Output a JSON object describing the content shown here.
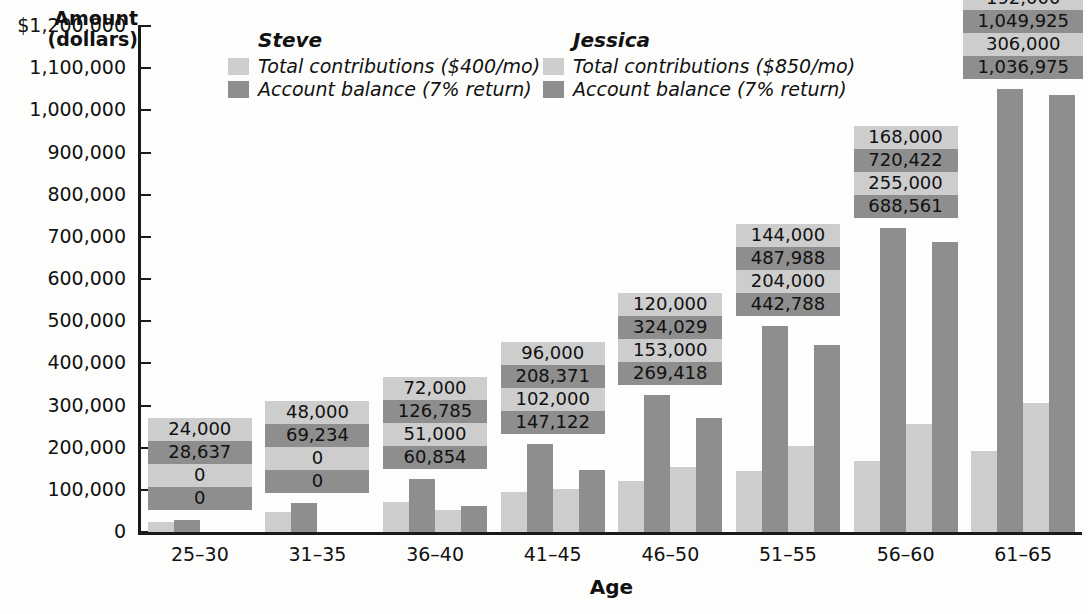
{
  "axes": {
    "y_title_line1": "Amount",
    "y_title_line2": "(dollars)",
    "x_title": "Age",
    "y_ticks": [
      "$1,200,000",
      "1,100,000",
      "1,000,000",
      "900,000",
      "800,000",
      "700,000",
      "600,000",
      "500,000",
      "400,000",
      "300,000",
      "200,000",
      "100,000",
      "0"
    ]
  },
  "legend": {
    "steve": {
      "title": "Steve",
      "series1": "Total contributions ($400/mo)",
      "series2": "Account balance (7% return)"
    },
    "jessica": {
      "title": "Jessica",
      "series1": "Total contributions ($850/mo)",
      "series2": "Account balance (7% return)"
    }
  },
  "colors": {
    "light": "#cdcdcd",
    "dark": "#8e8e8e",
    "axis": "#1a1a1a",
    "text": "#111111",
    "background": "#fdfdfc"
  },
  "chart_data": {
    "type": "bar",
    "title": "",
    "xlabel": "Age",
    "ylabel": "Amount (dollars)",
    "ylim": [
      0,
      1200000
    ],
    "ytick_step": 100000,
    "grid": false,
    "legend_position": "top",
    "categories": [
      "25–30",
      "31–35",
      "36–40",
      "41–45",
      "46–50",
      "51–55",
      "56–60",
      "61–65"
    ],
    "series": [
      {
        "name": "Steve — Total contributions ($400/mo)",
        "color": "#cdcdcd",
        "values": [
          24000,
          48000,
          72000,
          96000,
          120000,
          144000,
          168000,
          192000
        ],
        "labels": [
          "24,000",
          "48,000",
          "72,000",
          "96,000",
          "120,000",
          "144,000",
          "168,000",
          "192,000"
        ]
      },
      {
        "name": "Steve — Account balance (7% return)",
        "color": "#8e8e8e",
        "values": [
          28637,
          69234,
          126785,
          208371,
          324029,
          487988,
          720422,
          1049925
        ],
        "labels": [
          "28,637",
          "69,234",
          "126,785",
          "208,371",
          "324,029",
          "487,988",
          "720,422",
          "1,049,925"
        ]
      },
      {
        "name": "Jessica — Total contributions ($850/mo)",
        "color": "#cdcdcd",
        "values": [
          0,
          0,
          51000,
          102000,
          153000,
          204000,
          255000,
          306000
        ],
        "labels": [
          "0",
          "0",
          "51,000",
          "102,000",
          "153,000",
          "204,000",
          "255,000",
          "306,000"
        ]
      },
      {
        "name": "Jessica — Account balance (7% return)",
        "color": "#8e8e8e",
        "values": [
          0,
          0,
          60854,
          147122,
          269418,
          442788,
          688561,
          1036975
        ],
        "labels": [
          "0",
          "0",
          "60,854",
          "147,122",
          "269,418",
          "442,788",
          "688,561",
          "1,036,975"
        ]
      }
    ]
  }
}
